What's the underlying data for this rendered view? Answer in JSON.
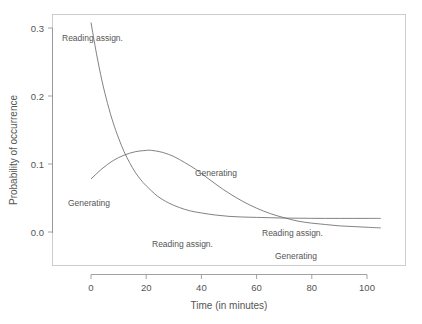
{
  "chart_data": {
    "type": "line",
    "title": "",
    "xlabel": "Time (in minutes)",
    "ylabel": "Probability of occurrence",
    "xlim": [
      -8,
      112
    ],
    "ylim": [
      -0.02,
      0.345
    ],
    "xticks": [
      0,
      20,
      40,
      60,
      80,
      100
    ],
    "xticklabels": [
      "0",
      "20",
      "40",
      "60",
      "80",
      "100"
    ],
    "yticks": [
      0.0,
      0.1,
      0.2,
      0.3
    ],
    "yticklabels": [
      "0.0",
      "0.1",
      "0.2",
      "0.3"
    ],
    "grid": false,
    "legend": "inline-curve-labels",
    "series": [
      {
        "name": "Reading assign.",
        "color": "#6b6b6b",
        "x": [
          0,
          2,
          4,
          6,
          8,
          10,
          12,
          14,
          16,
          18,
          20,
          24,
          28,
          32,
          36,
          40,
          45,
          50,
          55,
          60,
          65,
          70,
          75,
          80,
          85,
          90,
          95,
          100,
          105
        ],
        "y": [
          0.308,
          0.262,
          0.222,
          0.189,
          0.161,
          0.138,
          0.118,
          0.102,
          0.088,
          0.077,
          0.068,
          0.053,
          0.043,
          0.036,
          0.031,
          0.028,
          0.025,
          0.023,
          0.022,
          0.0215,
          0.021,
          0.0205,
          0.0203,
          0.0201,
          0.02,
          0.02,
          0.02,
          0.02,
          0.02
        ]
      },
      {
        "name": "Generating",
        "color": "#6b6b6b",
        "x": [
          0,
          4,
          8,
          12,
          16,
          20,
          22,
          26,
          30,
          34,
          38,
          42,
          46,
          50,
          55,
          60,
          65,
          70,
          75,
          80,
          85,
          90,
          95,
          100,
          105
        ],
        "y": [
          0.078,
          0.093,
          0.105,
          0.113,
          0.118,
          0.12,
          0.12,
          0.117,
          0.111,
          0.102,
          0.092,
          0.08,
          0.068,
          0.057,
          0.045,
          0.035,
          0.027,
          0.021,
          0.016,
          0.013,
          0.011,
          0.009,
          0.008,
          0.007,
          0.006
        ]
      }
    ],
    "annotations": [
      {
        "text": "Reading assign.",
        "x_px": 62,
        "y_px": 41,
        "anchor": "start",
        "series": "Reading assign."
      },
      {
        "text": "Generating",
        "x_px": 68,
        "y_px": 206,
        "anchor": "start",
        "series": "Generating"
      },
      {
        "text": "Generating",
        "x_px": 195,
        "y_px": 176,
        "anchor": "start",
        "series": "Generating"
      },
      {
        "text": "Reading assign.",
        "x_px": 152,
        "y_px": 247,
        "anchor": "start",
        "series": "Reading assign."
      },
      {
        "text": "Reading assign.",
        "x_px": 262,
        "y_px": 236,
        "anchor": "start",
        "series": "Reading assign."
      },
      {
        "text": "Generating",
        "x_px": 275,
        "y_px": 259,
        "anchor": "start",
        "series": "Generating"
      }
    ]
  }
}
